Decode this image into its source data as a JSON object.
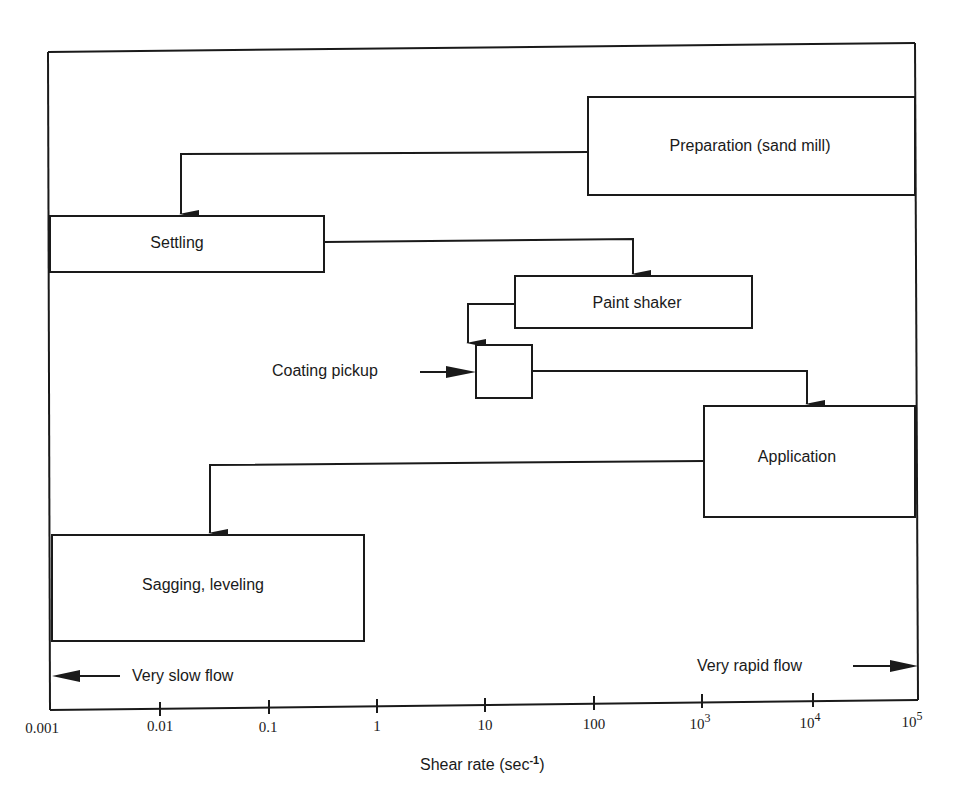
{
  "diagram": {
    "type": "process-flow-on-log-axis",
    "colors": {
      "ink": "#1a1a1a",
      "background": "#ffffff"
    },
    "stages": [
      {
        "id": "preparation",
        "label": "Preparation (sand mill)",
        "shear_range": [
          100,
          100000
        ]
      },
      {
        "id": "settling",
        "label": "Settling",
        "shear_range": [
          0.001,
          0.3
        ]
      },
      {
        "id": "paint_shaker",
        "label": "Paint shaker",
        "shear_range": [
          20,
          3000
        ]
      },
      {
        "id": "coating_pickup",
        "label": "Coating pickup",
        "shear_range": [
          10,
          50
        ]
      },
      {
        "id": "application",
        "label": "Application",
        "shear_range": [
          1000,
          100000
        ]
      },
      {
        "id": "sagging_leveling",
        "label": "Sagging, leveling",
        "shear_range": [
          0.001,
          0.7
        ]
      }
    ],
    "flow": [
      [
        "preparation",
        "settling"
      ],
      [
        "settling",
        "paint_shaker"
      ],
      [
        "paint_shaker",
        "coating_pickup"
      ],
      [
        "coating_pickup",
        "application"
      ],
      [
        "application",
        "sagging_leveling"
      ]
    ],
    "annotations": {
      "slow": "Very slow flow",
      "rapid": "Very rapid flow"
    },
    "axis": {
      "label_main": "Shear rate  (sec",
      "label_sup": "-1",
      "label_close": ")",
      "scale": "log",
      "range": [
        0.001,
        100000
      ],
      "ticks": [
        {
          "base": "0.001",
          "sup": ""
        },
        {
          "base": "0.01",
          "sup": ""
        },
        {
          "base": "0.1",
          "sup": ""
        },
        {
          "base": "1",
          "sup": ""
        },
        {
          "base": "10",
          "sup": ""
        },
        {
          "base": "100",
          "sup": ""
        },
        {
          "base": "10",
          "sup": "3"
        },
        {
          "base": "10",
          "sup": "4"
        },
        {
          "base": "10",
          "sup": "5"
        }
      ]
    }
  }
}
